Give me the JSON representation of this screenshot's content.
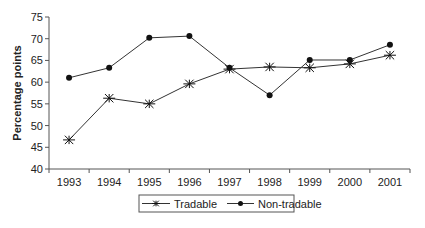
{
  "chart_data": {
    "type": "line",
    "title": "",
    "xlabel": "",
    "ylabel": "Percentage points",
    "ylim": [
      40,
      75
    ],
    "yticks": [
      40,
      45,
      50,
      55,
      60,
      65,
      70,
      75
    ],
    "categories": [
      "1993",
      "1994",
      "1995",
      "1996",
      "1997",
      "1998",
      "1999",
      "2000",
      "2001"
    ],
    "grid": false,
    "legend_position": "bottom-center",
    "series": [
      {
        "name": "Tradable",
        "marker": "asterisk",
        "values": [
          46.7,
          56.3,
          55.0,
          59.6,
          63.0,
          63.5,
          63.3,
          64.2,
          66.2
        ]
      },
      {
        "name": "Non-tradable",
        "marker": "dot",
        "values": [
          61.0,
          63.3,
          70.2,
          70.6,
          63.3,
          57.0,
          65.1,
          65.1,
          68.6
        ]
      }
    ]
  }
}
